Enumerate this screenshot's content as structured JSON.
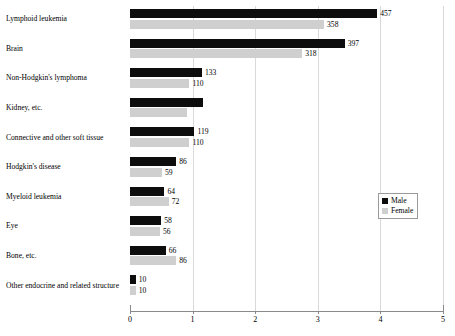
{
  "chart_data": {
    "type": "bar",
    "orientation": "horizontal",
    "title": "",
    "subtitle": "",
    "xlabel": "",
    "ylabel": "",
    "xlim": [
      0,
      5
    ],
    "xticks": [
      "0",
      "1",
      "2",
      "3",
      "4",
      "5"
    ],
    "grid": true,
    "legend_position": "center-right",
    "categories": [
      "Lymphoid leukemia",
      "Brain",
      "Non-Hodgkin's lymphoma",
      "Kidney, etc.",
      "Connective and other soft tissue",
      "Hodgkin's disease",
      "Myeloid leukemia",
      "Eye",
      "Bone, etc.",
      "Other endocrine and related structure"
    ],
    "series": [
      {
        "name": "Male",
        "color": "#0d0d0d",
        "values": [
          457,
          397,
          133,
          134,
          119,
          86,
          64,
          58,
          66,
          10
        ],
        "labels": [
          "457",
          "397",
          "133",
          "",
          "119",
          "86",
          "64",
          "58",
          "66",
          "10"
        ],
        "axis_values": [
          3.95,
          3.43,
          1.15,
          1.16,
          1.03,
          0.74,
          0.55,
          0.5,
          0.57,
          0.09
        ]
      },
      {
        "name": "Female",
        "color": "#cfcfcf",
        "values": [
          358,
          318,
          110,
          105,
          110,
          59,
          72,
          56,
          86,
          10
        ],
        "labels": [
          "358",
          "318",
          "110",
          "",
          "110",
          "59",
          "72",
          "56",
          "86",
          "10"
        ],
        "axis_values": [
          3.1,
          2.75,
          0.95,
          0.91,
          0.95,
          0.51,
          0.62,
          0.48,
          0.74,
          0.09
        ]
      }
    ]
  },
  "legend": {
    "items": [
      {
        "label": "Male",
        "color": "#0d0d0d"
      },
      {
        "label": "Female",
        "color": "#cfcfcf"
      }
    ]
  }
}
